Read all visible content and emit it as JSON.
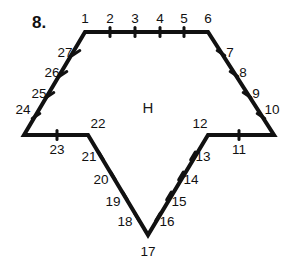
{
  "figure": {
    "problem_number": "8.",
    "interior_label": "H",
    "shape_type": "hexagon-with-v-notch",
    "stroke_color": "#111111",
    "background_color": "#ffffff",
    "outline_points": [
      {
        "x": 85,
        "y": 32
      },
      {
        "x": 208,
        "y": 32
      },
      {
        "x": 274,
        "y": 135
      },
      {
        "x": 208,
        "y": 135
      },
      {
        "x": 148,
        "y": 235
      },
      {
        "x": 88,
        "y": 135
      },
      {
        "x": 24,
        "y": 135
      }
    ],
    "point_labels": [
      {
        "n": "1",
        "x": 85,
        "y": 19,
        "tick": false
      },
      {
        "n": "2",
        "x": 110,
        "y": 19,
        "tick": true,
        "tx": 110,
        "ty": 32,
        "angle": 90
      },
      {
        "n": "3",
        "x": 135,
        "y": 19,
        "tick": true,
        "tx": 135,
        "ty": 32,
        "angle": 90
      },
      {
        "n": "4",
        "x": 160,
        "y": 19,
        "tick": true,
        "tx": 160,
        "ty": 32,
        "angle": 90
      },
      {
        "n": "5",
        "x": 184,
        "y": 19,
        "tick": true,
        "tx": 184,
        "ty": 32,
        "angle": 90
      },
      {
        "n": "6",
        "x": 208,
        "y": 19,
        "tick": false
      },
      {
        "n": "7",
        "x": 230,
        "y": 53,
        "tick": true,
        "tx": 221,
        "ty": 53,
        "angle": 147
      },
      {
        "n": "8",
        "x": 243,
        "y": 73,
        "tick": true,
        "tx": 234,
        "ty": 74,
        "angle": 147
      },
      {
        "n": "9",
        "x": 256,
        "y": 94,
        "tick": true,
        "tx": 247,
        "ty": 95,
        "angle": 147
      },
      {
        "n": "10",
        "x": 272,
        "y": 110,
        "tick": true,
        "tx": 261,
        "ty": 116,
        "angle": 147
      },
      {
        "n": "11",
        "x": 239,
        "y": 150,
        "tick": true,
        "tx": 239,
        "ty": 135,
        "angle": 90
      },
      {
        "n": "12",
        "x": 200,
        "y": 124,
        "tick": false
      },
      {
        "n": "13",
        "x": 203,
        "y": 157,
        "tick": true,
        "tx": 193,
        "ty": 156,
        "angle": 59
      },
      {
        "n": "14",
        "x": 191,
        "y": 180,
        "tick": true,
        "tx": 181,
        "ty": 176,
        "angle": 59
      },
      {
        "n": "15",
        "x": 179,
        "y": 202,
        "tick": true,
        "tx": 169,
        "ty": 196,
        "angle": 59
      },
      {
        "n": "16",
        "x": 167,
        "y": 222,
        "tick": true,
        "tx": 158,
        "ty": 217,
        "angle": 59
      },
      {
        "n": "17",
        "x": 148,
        "y": 252,
        "tick": false
      },
      {
        "n": "18",
        "x": 125,
        "y": 222,
        "tick": true,
        "tx": 137,
        "ty": 217,
        "angle": 121
      },
      {
        "n": "19",
        "x": 113,
        "y": 202,
        "tick": true,
        "tx": 125,
        "ty": 196,
        "angle": 121
      },
      {
        "n": "20",
        "x": 101,
        "y": 180,
        "tick": true,
        "tx": 113,
        "ty": 176,
        "angle": 121
      },
      {
        "n": "21",
        "x": 89,
        "y": 157,
        "tick": true,
        "tx": 101,
        "ty": 156,
        "angle": 121
      },
      {
        "n": "22",
        "x": 98,
        "y": 124,
        "tick": false
      },
      {
        "n": "23",
        "x": 57,
        "y": 150,
        "tick": true,
        "tx": 57,
        "ty": 135,
        "angle": 90
      },
      {
        "n": "24",
        "x": 23,
        "y": 110,
        "tick": true,
        "tx": 36,
        "ty": 116,
        "angle": 33
      },
      {
        "n": "25",
        "x": 39,
        "y": 94,
        "tick": true,
        "tx": 50,
        "ty": 95,
        "angle": 33
      },
      {
        "n": "26",
        "x": 52,
        "y": 73,
        "tick": true,
        "tx": 63,
        "ty": 74,
        "angle": 33
      },
      {
        "n": "27",
        "x": 65,
        "y": 53,
        "tick": true,
        "tx": 76,
        "ty": 53,
        "angle": 33
      }
    ]
  }
}
